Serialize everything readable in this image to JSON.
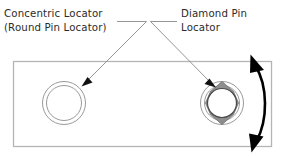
{
  "diagram": {
    "background_color": "#ffffff",
    "labels": {
      "left": {
        "line1": "Concentric Locator",
        "line2": "(Round Pin Locator)"
      },
      "right": {
        "line1": "Diamond Pin",
        "line2": "Locator"
      }
    },
    "colors": {
      "text": "#2b2b2b",
      "plate_outline": "#b5b5b5",
      "ring_stroke": "#9a9a9a",
      "diamond_fill": "#8e8e8e",
      "diamond_bore": "#ffffff",
      "leader_line": "#8a8a8a",
      "leader_head": "#111111",
      "swing_arrow": "#000000"
    },
    "parts": {
      "plate_name": "workpiece-plate",
      "round_locator_name": "Concentric Locator",
      "diamond_locator_name": "Diamond Pin Locator",
      "motion_indicator": "swing-direction-arrow"
    }
  }
}
